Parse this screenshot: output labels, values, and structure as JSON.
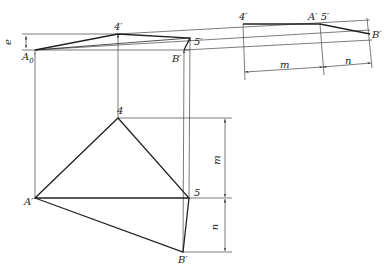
{
  "diagram": {
    "type": "descriptive-geometry-projection",
    "labels": {
      "e": "e",
      "A0_prime": "A",
      "A0_sub": "0",
      "A0_mark": "′",
      "four_prime_top": "4′",
      "five_prime_top": "5′",
      "B_prime_top": "B′",
      "four_prime_aux": "4′",
      "A_five_prime_aux": "A′ 5′",
      "B_prime_aux": "B′",
      "m_aux": "m",
      "n_aux": "n",
      "four_plan": "4",
      "A_plan": "A′",
      "five_plan": "5",
      "B_prime_plan": "B′",
      "m_plan": "m",
      "n_plan": "n"
    },
    "points": {
      "A0_top": [
        35,
        50
      ],
      "4_top": [
        118,
        34
      ],
      "5_top": [
        190,
        38
      ],
      "B_top": [
        184,
        50
      ],
      "4_aux": [
        243,
        24
      ],
      "A5_aux": [
        320,
        24
      ],
      "B_aux": [
        370,
        34
      ],
      "4_plan": [
        118,
        118
      ],
      "A_plan": [
        35,
        198
      ],
      "5_plan": [
        189,
        198
      ],
      "B_plan": [
        183,
        252
      ]
    },
    "colors": {
      "line": "#222222",
      "thin": "#444444",
      "background": "#ffffff"
    }
  }
}
